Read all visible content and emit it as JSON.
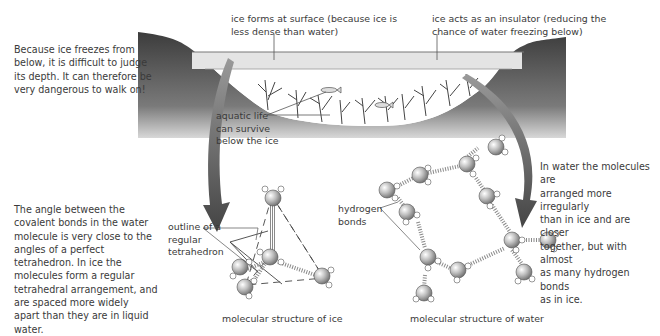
{
  "diagram": {
    "left_note_top": "Because ice freezes from\nbelow, it is difficult to judge\nits depth. It can therefore be\nvery dangerous to walk on!",
    "label_ice_surface": "ice forms at surface (because ice is\nless dense than water)",
    "label_insulator": "ice acts as an insulator (reducing the\nchance of water freezing below)",
    "label_aquatic": "aquatic life\ncan survive\nbelow the ice",
    "left_note_bottom": "The angle between the\ncovalent bonds in the water\nmolecule is very close to the\nangles of a perfect\ntetrahedron. In ice the\nmolecules form a regular\ntetrahedral arrangement, and\nare spaced more widely\napart than they are in liquid\nwater.",
    "label_tetrahedron": "outline of a\nregular\ntetrahedron",
    "label_hbonds": "hydrogen\nbonds",
    "right_note": "In water the molecules are\narranged more irregularly\nthan in ice and are closer\ntogether, but with almost\nas many hydrogen bonds\nas in ice.",
    "caption_ice": "molecular structure of ice",
    "caption_water": "molecular structure of water"
  },
  "colors": {
    "ground_dark": "#3f3f3f",
    "ice_layer": "#e6e6e6",
    "arrow": "#555555"
  }
}
